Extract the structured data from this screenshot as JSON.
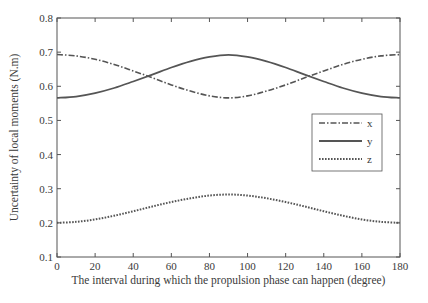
{
  "chart_data": {
    "type": "line",
    "title": "",
    "xlabel": "The interval during which the propulsion phase can happen (degree)",
    "ylabel": "Uncertainty of local moments (N.m)",
    "xlim": [
      0,
      180
    ],
    "ylim": [
      0.1,
      0.8
    ],
    "xticks": [
      0,
      20,
      40,
      60,
      80,
      100,
      120,
      140,
      160,
      180
    ],
    "yticks": [
      0.1,
      0.2,
      0.3,
      0.4,
      0.5,
      0.6,
      0.7,
      0.8
    ],
    "xtick_labels": [
      "0",
      "20",
      "40",
      "60",
      "80",
      "100",
      "120",
      "140",
      "160",
      "180"
    ],
    "ytick_labels": [
      "0.1",
      "0.2",
      "0.3",
      "0.4",
      "0.5",
      "0.6",
      "0.7",
      "0.8"
    ],
    "grid": false,
    "legend_position": "right, inside plot",
    "x": [
      0,
      10,
      20,
      30,
      40,
      50,
      60,
      70,
      80,
      90,
      100,
      110,
      120,
      130,
      140,
      150,
      160,
      170,
      180
    ],
    "series": [
      {
        "name": "x",
        "style": "dash-dot",
        "color": "#555555",
        "values": [
          0.693,
          0.689,
          0.679,
          0.664,
          0.645,
          0.625,
          0.604,
          0.586,
          0.572,
          0.566,
          0.572,
          0.586,
          0.604,
          0.625,
          0.645,
          0.664,
          0.679,
          0.689,
          0.693
        ]
      },
      {
        "name": "y",
        "style": "solid",
        "color": "#555555",
        "values": [
          0.566,
          0.57,
          0.58,
          0.595,
          0.614,
          0.634,
          0.655,
          0.673,
          0.686,
          0.692,
          0.686,
          0.673,
          0.655,
          0.634,
          0.614,
          0.595,
          0.58,
          0.57,
          0.566
        ]
      },
      {
        "name": "z",
        "style": "dotted",
        "color": "#555555",
        "values": [
          0.2,
          0.203,
          0.21,
          0.221,
          0.234,
          0.248,
          0.261,
          0.272,
          0.28,
          0.283,
          0.28,
          0.272,
          0.261,
          0.248,
          0.234,
          0.221,
          0.21,
          0.203,
          0.2
        ]
      }
    ]
  }
}
